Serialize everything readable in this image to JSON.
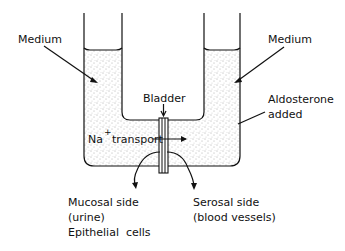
{
  "diagram": {
    "labels": {
      "medium_left": "Medium",
      "medium_right": "Medium",
      "bladder": "Bladder",
      "aldosterone_line1": "Aldosterone",
      "aldosterone_line2": "added",
      "na": "Na",
      "na_sup": "+",
      "transport": "transport",
      "mucosal_line1": "Mucosal side",
      "mucosal_line2": "(urine)",
      "mucosal_line3": "Epithelial  cells",
      "serosal_line1": "Serosal side",
      "serosal_line2": "(blood vessels)"
    },
    "colors": {
      "ink": "#111111",
      "background": "#ffffff",
      "stipple": "#555555"
    }
  }
}
